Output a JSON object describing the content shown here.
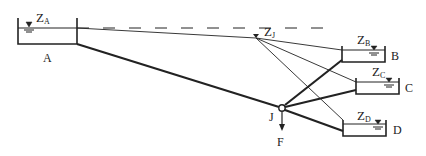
{
  "colors": {
    "ink": "#222222",
    "background": "#ffffff"
  },
  "reservoirs": [
    {
      "id": "A",
      "label": "A",
      "head_label": "Z",
      "head_sub": "A"
    },
    {
      "id": "B",
      "label": "B",
      "head_label": "Z",
      "head_sub": "B"
    },
    {
      "id": "C",
      "label": "C",
      "head_label": "Z",
      "head_sub": "C"
    },
    {
      "id": "D",
      "label": "D",
      "head_label": "Z",
      "head_sub": "D"
    }
  ],
  "junction": {
    "label": "J",
    "head_label": "Z",
    "head_sub": "J",
    "outflow_label": "F"
  }
}
